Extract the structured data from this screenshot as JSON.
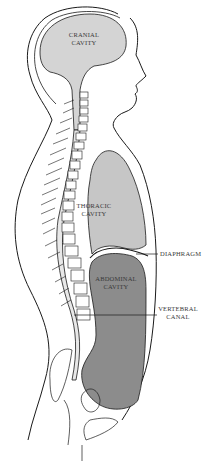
{
  "diagram": {
    "colors": {
      "outline": "#1a1a1a",
      "cranial_fill": "#d4d4d4",
      "thoracic_fill": "#c6c6c6",
      "abdominal_fill": "#8c8c8c",
      "background": "#ffffff"
    },
    "labels": {
      "cranial_1": "CRANIAL",
      "cranial_2": "CAVITY",
      "thoracic_1": "THORACIC",
      "thoracic_2": "CAVITY",
      "abdominal_1": "ABDOMINAL",
      "abdominal_2": "CAVITY",
      "diaphragm": "DIAPHRAGM",
      "vertebral_1": "VERTEBRAL",
      "vertebral_2": "CANAL"
    }
  }
}
